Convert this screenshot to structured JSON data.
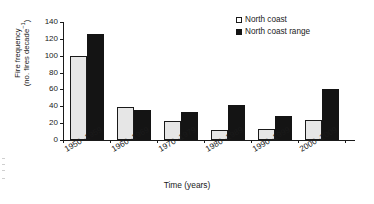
{
  "chart_data": {
    "type": "bar",
    "title": "",
    "xlabel": "Time (years)",
    "ylabel": "Fire frequency (no. fires decade⁻¹)",
    "ylabel_line1": "Fire frequency",
    "ylabel_line2_prefix": "(no. fires decade",
    "ylabel_line2_sup": "−1",
    "ylabel_line2_suffix": ")",
    "categories": [
      "1950–1959",
      "1960–1969",
      "1970–1979",
      "1980–1989",
      "1990–1999",
      "2000–2009"
    ],
    "series": [
      {
        "name": "North coast",
        "values": [
          100,
          39,
          22,
          12,
          13,
          24
        ],
        "color": "#e6e6e6",
        "edge": "#1a1a1a"
      },
      {
        "name": "North coast range",
        "values": [
          126,
          36,
          33,
          42,
          28,
          61
        ],
        "color": "#141414",
        "edge": "#141414"
      }
    ],
    "ylim": [
      0,
      140
    ],
    "yticks": [
      0,
      20,
      40,
      60,
      80,
      100,
      120,
      140
    ],
    "ytick_labels": [
      "0",
      "20",
      "40",
      "60",
      "80",
      "100",
      "120",
      "140"
    ],
    "grid": false,
    "legend_position": "top-right"
  },
  "legend": {
    "items": [
      {
        "label": "North coast",
        "marker": "open-square"
      },
      {
        "label": "North coast range",
        "marker": "filled-square"
      }
    ]
  }
}
